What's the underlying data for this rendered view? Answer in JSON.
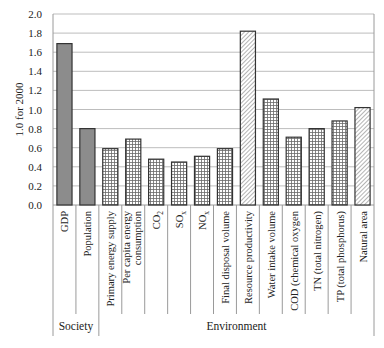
{
  "chart_data": {
    "type": "bar",
    "title": "",
    "xlabel": "",
    "ylabel": "1.0 for 2000",
    "ylim": [
      0,
      2.0
    ],
    "yticks": [
      "0.0",
      "0.2",
      "0.4",
      "0.6",
      "0.8",
      "1.0",
      "1.2",
      "1.4",
      "1.6",
      "1.8",
      "2.0"
    ],
    "grid": true,
    "legend": null,
    "categories": [
      "GDP",
      "Population",
      "Primary energy supply",
      "Per capita energy consumption",
      "CO2",
      "SOx",
      "NOx",
      "Final disposal volume",
      "Resource productivity",
      "Water intake volume",
      "COD (chemical oxygen",
      "TN (total nitrogen)",
      "TP (total phosphorus)",
      "Natural area"
    ],
    "category_label_lines": [
      [
        "GDP"
      ],
      [
        "Population"
      ],
      [
        "Primary energy supply"
      ],
      [
        "Per capita energy",
        "consumption"
      ],
      [
        "CO",
        "2"
      ],
      [
        "SO",
        "x"
      ],
      [
        "NO",
        "x"
      ],
      [
        "Final disposal volume"
      ],
      [
        "Resource productivity"
      ],
      [
        "Water intake volume"
      ],
      [
        "COD (chemical oxygen"
      ],
      [
        "TN (total nitrogen)"
      ],
      [
        "TP (total phosphorus)"
      ],
      [
        "Natural area"
      ]
    ],
    "values": [
      1.69,
      0.8,
      0.59,
      0.69,
      0.48,
      0.45,
      0.51,
      0.59,
      1.82,
      1.11,
      0.71,
      0.8,
      0.88,
      1.02
    ],
    "fills": [
      "solid",
      "solid",
      "grid",
      "grid",
      "grid",
      "grid",
      "grid",
      "grid",
      "hatch",
      "grid",
      "grid",
      "grid",
      "grid",
      "hatch"
    ],
    "groups": [
      {
        "label": "Society",
        "start": 0,
        "end": 1
      },
      {
        "label": "Environment",
        "start": 2,
        "end": 13
      }
    ],
    "colors": {
      "solid": "#8c8c8c",
      "bar_border": "#333333",
      "grid": "#bdbdbd",
      "axis": "#9a9a9a"
    }
  }
}
